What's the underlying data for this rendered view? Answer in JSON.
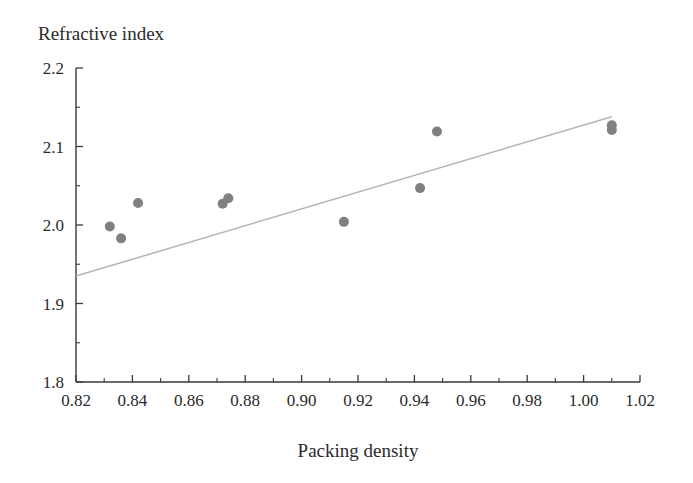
{
  "chart_data": {
    "type": "scatter",
    "title": "",
    "ylabel": "Refractive index",
    "xlabel": "Packing density",
    "xlim": [
      0.82,
      1.02
    ],
    "ylim": [
      1.8,
      2.2
    ],
    "grid": false,
    "legend": null,
    "x_major_ticks": [
      0.82,
      0.84,
      0.86,
      0.88,
      0.9,
      0.92,
      0.94,
      0.96,
      0.98,
      1.0,
      1.02
    ],
    "x_tick_labels": [
      "0.82",
      "0.84",
      "0.86",
      "0.88",
      "0.90",
      "0.92",
      "0.94",
      "0.96",
      "0.98",
      "1.00",
      "1.02"
    ],
    "x_minor_ticks": [
      0.83,
      0.85,
      0.87,
      0.89,
      0.91,
      0.93,
      0.95,
      0.97,
      0.99,
      1.01
    ],
    "y_major_ticks": [
      1.8,
      1.9,
      2.0,
      2.1,
      2.2
    ],
    "y_tick_labels": [
      "1.8",
      "1.9",
      "2.0",
      "2.1",
      "2.2"
    ],
    "y_minor_ticks": [
      1.85,
      1.95,
      2.05,
      2.15
    ],
    "marker_color": "#808080",
    "marker_radius": 5,
    "trendline_color": "#b4b4b4",
    "points": [
      {
        "x": 0.832,
        "y": 1.998
      },
      {
        "x": 0.836,
        "y": 1.983
      },
      {
        "x": 0.842,
        "y": 2.028
      },
      {
        "x": 0.872,
        "y": 2.027
      },
      {
        "x": 0.874,
        "y": 2.034
      },
      {
        "x": 0.915,
        "y": 2.004
      },
      {
        "x": 0.942,
        "y": 2.047
      },
      {
        "x": 0.948,
        "y": 2.119
      },
      {
        "x": 1.01,
        "y": 2.127
      },
      {
        "x": 1.01,
        "y": 2.121
      }
    ],
    "trendline": {
      "x0": 0.82,
      "y0": 1.935,
      "x1": 1.01,
      "y1": 2.138
    }
  },
  "labels": {
    "y_axis_title": "Refractive index",
    "x_axis_title": "Packing density"
  }
}
